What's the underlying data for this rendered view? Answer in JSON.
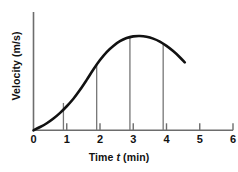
{
  "chart_data": {
    "type": "line",
    "title": "",
    "subtitle": "",
    "xlabel_prefix": "Time ",
    "xlabel_symbol": "t",
    "xlabel_suffix": " (min)",
    "xlabel": "Time t (min)",
    "ylabel": "Velocity (m/s)",
    "xlim": [
      0,
      6
    ],
    "ylim": [
      0,
      1.08
    ],
    "xticks": [
      0,
      1,
      2,
      3,
      4,
      5,
      6
    ],
    "xtick_labels": [
      "0",
      "1",
      "2",
      "3",
      "4",
      "5",
      "6"
    ],
    "yticks": [],
    "ytick_labels": [],
    "grid": false,
    "legend": null,
    "axis_color": "#6d6d6d",
    "curve_color": "#111111",
    "dropline_color": "#767676",
    "series": [
      {
        "name": "velocity",
        "comment": "S-shaped rise from origin to a maximum near t=3.2, then a gentle decline; values normalized to peak = 1.0",
        "x": [
          0.0,
          0.2,
          0.4,
          0.6,
          0.8,
          1.0,
          1.2,
          1.4,
          1.6,
          1.8,
          2.0,
          2.2,
          2.4,
          2.6,
          2.8,
          3.0,
          3.2,
          3.4,
          3.6,
          3.8,
          4.0,
          4.2,
          4.4,
          4.55
        ],
        "y": [
          0.0,
          0.035,
          0.075,
          0.125,
          0.185,
          0.255,
          0.335,
          0.43,
          0.535,
          0.645,
          0.745,
          0.83,
          0.895,
          0.945,
          0.978,
          0.996,
          1.0,
          0.992,
          0.972,
          0.94,
          0.895,
          0.84,
          0.775,
          0.72
        ]
      }
    ],
    "droplines": [
      {
        "label": "t1",
        "x": 0.9,
        "y": 0.29
      },
      {
        "label": "t2",
        "x": 1.9,
        "y": 0.695
      },
      {
        "label": "t3",
        "x": 2.9,
        "y": 0.99
      },
      {
        "label": "t4",
        "x": 3.9,
        "y": 0.918
      }
    ]
  }
}
